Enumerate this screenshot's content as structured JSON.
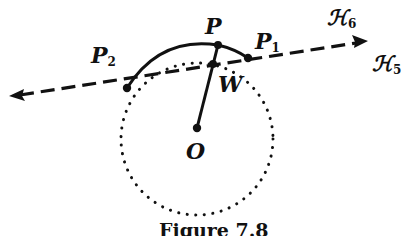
{
  "figure": {
    "caption": "Figure 7.8",
    "points": {
      "P": {
        "name": "P",
        "sub": ""
      },
      "P1": {
        "name": "P",
        "sub": "1"
      },
      "P2": {
        "name": "P",
        "sub": "2"
      },
      "W": {
        "name": "W",
        "sub": ""
      },
      "O": {
        "name": "O",
        "sub": ""
      }
    },
    "lines": {
      "H6": {
        "name": "ℋ",
        "sub": "6"
      },
      "H5": {
        "name": "ℋ",
        "sub": "5"
      }
    },
    "colors": {
      "ink": "#111111",
      "background": "#ffffff"
    }
  }
}
